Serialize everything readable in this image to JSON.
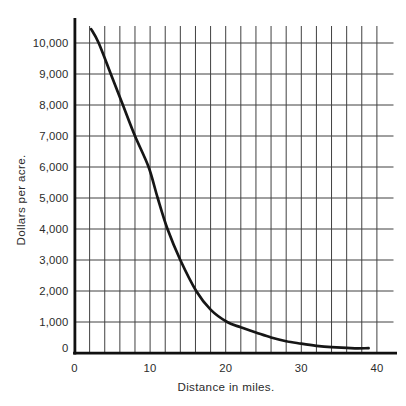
{
  "page": {
    "background": "#ffffff"
  },
  "chart_data": {
    "type": "line",
    "title": "",
    "xlabel": "Distance in miles.",
    "ylabel": "Dollars per acre.",
    "xlim": [
      0,
      40
    ],
    "ylim": [
      0,
      10600
    ],
    "grid": "on",
    "legend": "none",
    "x_grid_interval": 2,
    "y_grid_interval": 1000,
    "x_ticks": [
      {
        "value": 0,
        "label": "0"
      },
      {
        "value": 10,
        "label": "10"
      },
      {
        "value": 20,
        "label": "20"
      },
      {
        "value": 30,
        "label": "30"
      },
      {
        "value": 40,
        "label": "40"
      }
    ],
    "y_ticks": [
      {
        "value": 0,
        "label": "0"
      },
      {
        "value": 1000,
        "label": "1,000"
      },
      {
        "value": 2000,
        "label": "2,000"
      },
      {
        "value": 3000,
        "label": "3,000"
      },
      {
        "value": 4000,
        "label": "4,000"
      },
      {
        "value": 5000,
        "label": "5,000"
      },
      {
        "value": 6000,
        "label": "6,000"
      },
      {
        "value": 7000,
        "label": "7,000"
      },
      {
        "value": 8000,
        "label": "8,000"
      },
      {
        "value": 9000,
        "label": "9,000"
      },
      {
        "value": 10000,
        "label": "10,000"
      }
    ],
    "series": [
      {
        "name": "dollars-per-acre-vs-distance",
        "points": [
          [
            2.2,
            10450
          ],
          [
            3.2,
            10000
          ],
          [
            4.8,
            9000
          ],
          [
            6.4,
            8000
          ],
          [
            8.0,
            7000
          ],
          [
            9.8,
            6000
          ],
          [
            11.0,
            5000
          ],
          [
            12.3,
            4000
          ],
          [
            14.0,
            3000
          ],
          [
            16.1,
            2000
          ],
          [
            18.0,
            1400
          ],
          [
            20.2,
            1000
          ],
          [
            22.0,
            830
          ],
          [
            24.0,
            660
          ],
          [
            26.0,
            500
          ],
          [
            28.0,
            380
          ],
          [
            30.0,
            300
          ],
          [
            32.0,
            230
          ],
          [
            34.0,
            190
          ],
          [
            36.0,
            165
          ],
          [
            37.5,
            150
          ],
          [
            38.9,
            155
          ]
        ]
      }
    ],
    "colors": {
      "curve": "#161616",
      "grid": "#404040",
      "axis": "#101010",
      "text": "#2b2b2b",
      "background": "#ffffff"
    }
  }
}
